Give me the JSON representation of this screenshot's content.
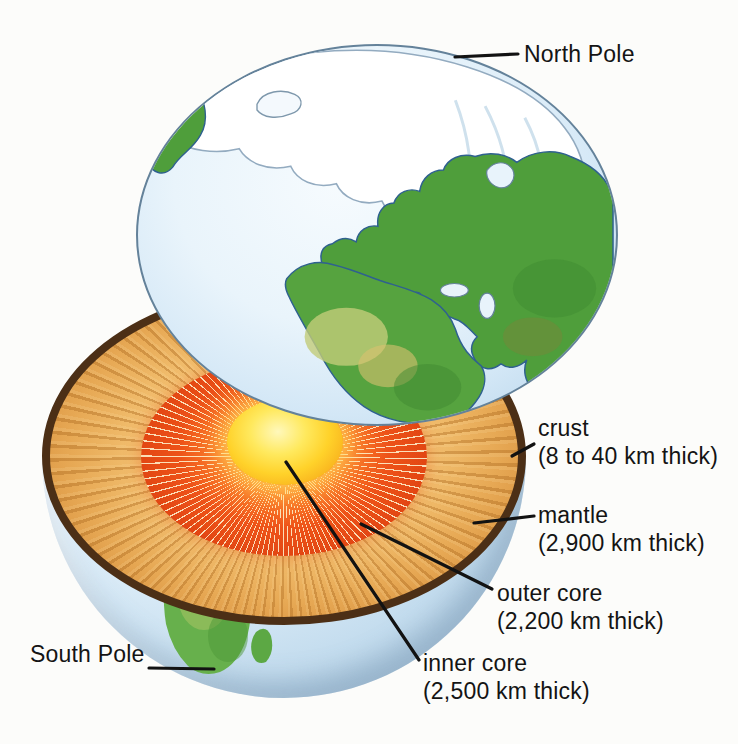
{
  "diagram": {
    "poles": {
      "north": "North Pole",
      "south": "South Pole"
    },
    "layers": {
      "crust": {
        "label": "crust",
        "thickness": "(8 to 40 km thick)"
      },
      "mantle": {
        "label": "mantle",
        "thickness": "(2,900 km thick)"
      },
      "outer_core": {
        "label": "outer core",
        "thickness": "(2,200 km thick)"
      },
      "inner_core": {
        "label": "inner core",
        "thickness": "(2,500 km thick)"
      }
    },
    "colors": {
      "mantle_tan": "#e8a855",
      "outer_core_red": "#e84e16",
      "inner_core_yellow": "#ffd826",
      "crust_rim_brown": "#4c2f16",
      "ocean_blue": "#cfe5f5",
      "land_green": "#4f9e3b",
      "polar_cap_white": "#ffffff",
      "label_text": "#141414",
      "background": "#fcfcfa"
    }
  }
}
